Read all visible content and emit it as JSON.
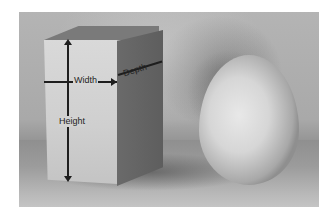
{
  "photo": {
    "subject": "Rectangular box with dimension labels beside an egg",
    "labels": {
      "width": "Width",
      "height": "Height",
      "depth": "Depth"
    },
    "colors": {
      "background": "#ffffff",
      "wall": "#b4b4b4",
      "box_front": "#d6d6d6",
      "box_side": "#616161",
      "egg": "#dcdcdc",
      "annotation": "#1e1e1e"
    }
  }
}
